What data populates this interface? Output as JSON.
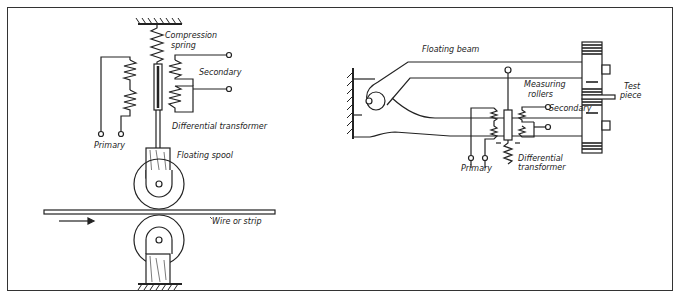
{
  "figure": {
    "left_diagram": {
      "labels": {
        "compression_spring_line1": "Compression",
        "compression_spring_line2": "spring",
        "secondary": "Secondary",
        "differential_transformer": "Differential transformer",
        "primary": "Primary",
        "floating_spool": "Floating spool",
        "wire_or_strip": "Wire or strip"
      }
    },
    "right_diagram": {
      "labels": {
        "floating_beam": "Floating beam",
        "measuring_rollers_line1": "Measuring",
        "measuring_rollers_line2": "rollers",
        "test_piece_line1": "Test",
        "test_piece_line2": "piece",
        "secondary": "Secondary",
        "primary": "Primary",
        "differential_transformer_line1": "Differential",
        "differential_transformer_line2": "transformer"
      }
    }
  }
}
